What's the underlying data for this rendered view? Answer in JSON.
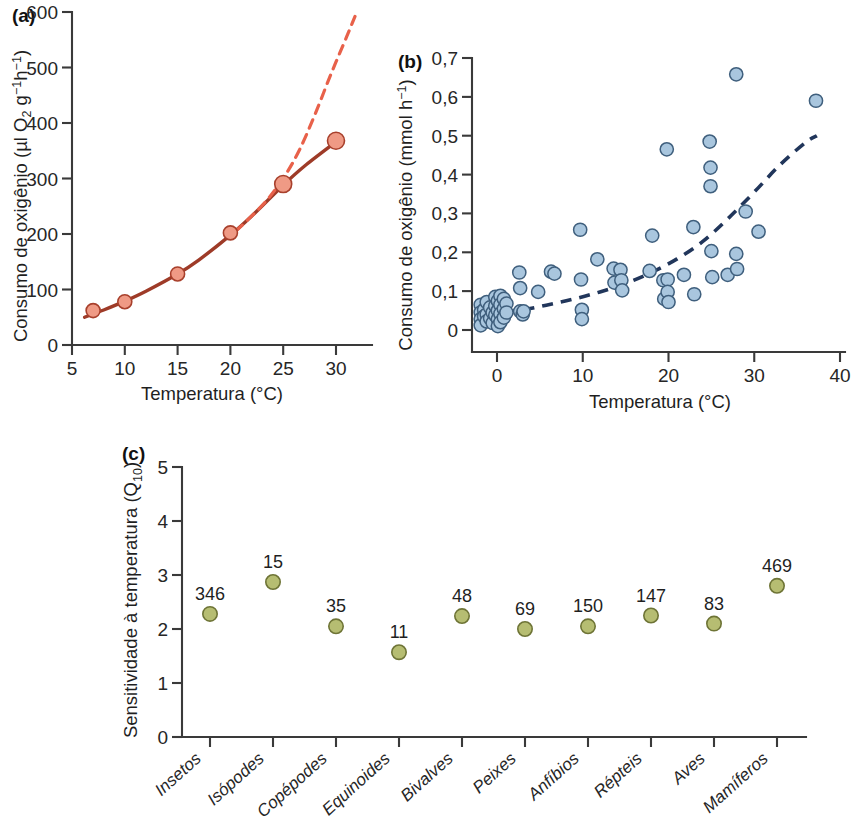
{
  "figure": {
    "panels": [
      "a",
      "b",
      "c"
    ]
  },
  "chart_data": [
    {
      "id": "panel-a",
      "type": "scatter",
      "panel_tag": "(a)",
      "title": "",
      "xlabel": "Temperatura (°C)",
      "ylabel_parts": {
        "prefix": "Consumo de oxigênio (µl O",
        "sub1": "2",
        "mid": " g",
        "sup1": "−1",
        "mid2": "h",
        "sup2": "−1",
        "suffix": ")"
      },
      "ylabel": "Consumo de oxigênio (µl O2 g−1h−1)",
      "xlim": [
        5,
        32.5
      ],
      "ylim": [
        0,
        600
      ],
      "xticks": [
        5,
        10,
        15,
        20,
        25,
        30
      ],
      "xticklabels": [
        "5",
        "10",
        "15",
        "20",
        "25",
        "30"
      ],
      "yticks": [
        0,
        100,
        200,
        300,
        400,
        500,
        600
      ],
      "yticklabels": [
        "0",
        "100",
        "200",
        "300",
        "400",
        "500",
        "600"
      ],
      "grid": false,
      "legend": "none",
      "marker_color": "#ef9a85",
      "marker_edge_color": "#a8402c",
      "points": [
        {
          "x": 7,
          "y": 62
        },
        {
          "x": 10,
          "y": 78
        },
        {
          "x": 15,
          "y": 128
        },
        {
          "x": 20,
          "y": 202
        },
        {
          "x": 25,
          "y": 290
        },
        {
          "x": 30,
          "y": 368
        }
      ],
      "curves": [
        {
          "name": "curva-ajustada-solida",
          "style": "solid",
          "color": "#9e3b28",
          "points": [
            {
              "x": 6.2,
              "y": 50
            },
            {
              "x": 7,
              "y": 56
            },
            {
              "x": 8,
              "y": 63
            },
            {
              "x": 10,
              "y": 79
            },
            {
              "x": 12,
              "y": 97
            },
            {
              "x": 15,
              "y": 128
            },
            {
              "x": 17,
              "y": 153
            },
            {
              "x": 20,
              "y": 198
            },
            {
              "x": 22,
              "y": 232
            },
            {
              "x": 25,
              "y": 288
            },
            {
              "x": 27,
              "y": 322
            },
            {
              "x": 30,
              "y": 366
            }
          ]
        },
        {
          "name": "curva-extrapolada-tracejada",
          "style": "dashed",
          "color": "#e8614a",
          "points": [
            {
              "x": 20.5,
              "y": 205
            },
            {
              "x": 22,
              "y": 232
            },
            {
              "x": 23.5,
              "y": 262
            },
            {
              "x": 25,
              "y": 300
            },
            {
              "x": 26.5,
              "y": 350
            },
            {
              "x": 28,
              "y": 415
            },
            {
              "x": 29.5,
              "y": 487
            },
            {
              "x": 31,
              "y": 555
            },
            {
              "x": 31.8,
              "y": 592
            }
          ]
        }
      ]
    },
    {
      "id": "panel-b",
      "type": "scatter",
      "panel_tag": "(b)",
      "title": "",
      "xlabel": "Temperatura (°C)",
      "ylabel_parts": {
        "prefix": "Consumo de oxigênio (mmol h",
        "sup1": "−1",
        "suffix": ")"
      },
      "ylabel": "Consumo de oxigênio (mmol h−1)",
      "xlim": [
        -3,
        41
      ],
      "ylim": [
        0,
        0.7
      ],
      "xticks": [
        0,
        10,
        20,
        30,
        40
      ],
      "xticklabels": [
        "0",
        "10",
        "20",
        "30",
        "40"
      ],
      "yticks": [
        0,
        0.1,
        0.2,
        0.3,
        0.4,
        0.5,
        0.6,
        0.7
      ],
      "yticklabels": [
        "0",
        "0,1",
        "0,2",
        "0,3",
        "0,4",
        "0,5",
        "0,6",
        "0,7"
      ],
      "grid": false,
      "legend": "none",
      "marker_color": "#a9c6de",
      "marker_edge_color": "#3f5f7d",
      "points": [
        {
          "x": -1.9,
          "y": 0.065
        },
        {
          "x": -1.9,
          "y": 0.045
        },
        {
          "x": -1.9,
          "y": 0.028
        },
        {
          "x": -1.9,
          "y": 0.012
        },
        {
          "x": -1.5,
          "y": 0.052
        },
        {
          "x": -1.5,
          "y": 0.035
        },
        {
          "x": -1.2,
          "y": 0.072
        },
        {
          "x": -1.2,
          "y": 0.04
        },
        {
          "x": -1.2,
          "y": 0.022
        },
        {
          "x": -0.8,
          "y": 0.058
        },
        {
          "x": -0.8,
          "y": 0.03
        },
        {
          "x": -0.5,
          "y": 0.045
        },
        {
          "x": -0.5,
          "y": 0.018
        },
        {
          "x": -0.2,
          "y": 0.085
        },
        {
          "x": -0.2,
          "y": 0.062
        },
        {
          "x": -0.2,
          "y": 0.038
        },
        {
          "x": 0.1,
          "y": 0.075
        },
        {
          "x": 0.1,
          "y": 0.05
        },
        {
          "x": 0.1,
          "y": 0.028
        },
        {
          "x": 0.1,
          "y": 0.01
        },
        {
          "x": 0.4,
          "y": 0.088
        },
        {
          "x": 0.4,
          "y": 0.065
        },
        {
          "x": 0.4,
          "y": 0.042
        },
        {
          "x": 0.4,
          "y": 0.02
        },
        {
          "x": 0.8,
          "y": 0.08
        },
        {
          "x": 0.8,
          "y": 0.055
        },
        {
          "x": 0.8,
          "y": 0.032
        },
        {
          "x": 1.1,
          "y": 0.068
        },
        {
          "x": 1.1,
          "y": 0.045
        },
        {
          "x": 2.6,
          "y": 0.148
        },
        {
          "x": 2.7,
          "y": 0.108
        },
        {
          "x": 2.7,
          "y": 0.048
        },
        {
          "x": 3.0,
          "y": 0.04
        },
        {
          "x": 3.1,
          "y": 0.048
        },
        {
          "x": 4.8,
          "y": 0.098
        },
        {
          "x": 6.3,
          "y": 0.15
        },
        {
          "x": 6.7,
          "y": 0.145
        },
        {
          "x": 9.7,
          "y": 0.258
        },
        {
          "x": 9.8,
          "y": 0.13
        },
        {
          "x": 9.9,
          "y": 0.052
        },
        {
          "x": 9.9,
          "y": 0.028
        },
        {
          "x": 11.7,
          "y": 0.182
        },
        {
          "x": 13.6,
          "y": 0.158
        },
        {
          "x": 13.7,
          "y": 0.122
        },
        {
          "x": 14.4,
          "y": 0.155
        },
        {
          "x": 14.5,
          "y": 0.128
        },
        {
          "x": 14.6,
          "y": 0.102
        },
        {
          "x": 17.8,
          "y": 0.152
        },
        {
          "x": 18.1,
          "y": 0.243
        },
        {
          "x": 19.4,
          "y": 0.128
        },
        {
          "x": 19.5,
          "y": 0.08
        },
        {
          "x": 19.8,
          "y": 0.465
        },
        {
          "x": 19.9,
          "y": 0.13
        },
        {
          "x": 19.9,
          "y": 0.098
        },
        {
          "x": 20.0,
          "y": 0.072
        },
        {
          "x": 21.8,
          "y": 0.142
        },
        {
          "x": 22.9,
          "y": 0.265
        },
        {
          "x": 23.0,
          "y": 0.092
        },
        {
          "x": 24.8,
          "y": 0.485
        },
        {
          "x": 24.9,
          "y": 0.418
        },
        {
          "x": 24.9,
          "y": 0.37
        },
        {
          "x": 25.0,
          "y": 0.203
        },
        {
          "x": 25.1,
          "y": 0.136
        },
        {
          "x": 26.9,
          "y": 0.142
        },
        {
          "x": 27.9,
          "y": 0.658
        },
        {
          "x": 27.9,
          "y": 0.196
        },
        {
          "x": 28.0,
          "y": 0.157
        },
        {
          "x": 29.0,
          "y": 0.305
        },
        {
          "x": 30.5,
          "y": 0.253
        },
        {
          "x": 37.2,
          "y": 0.59
        }
      ],
      "curves": [
        {
          "name": "curva-ajustada-tracejada",
          "style": "dashed",
          "color": "#21365b",
          "points": [
            {
              "x": -1.3,
              "y": 0.04
            },
            {
              "x": 0,
              "y": 0.043
            },
            {
              "x": 3,
              "y": 0.052
            },
            {
              "x": 6,
              "y": 0.065
            },
            {
              "x": 9,
              "y": 0.08
            },
            {
              "x": 12,
              "y": 0.098
            },
            {
              "x": 15,
              "y": 0.12
            },
            {
              "x": 18,
              "y": 0.148
            },
            {
              "x": 21,
              "y": 0.183
            },
            {
              "x": 24,
              "y": 0.228
            },
            {
              "x": 27,
              "y": 0.288
            },
            {
              "x": 30,
              "y": 0.355
            },
            {
              "x": 33,
              "y": 0.425
            },
            {
              "x": 36,
              "y": 0.483
            },
            {
              "x": 37.3,
              "y": 0.5
            }
          ]
        }
      ]
    },
    {
      "id": "panel-c",
      "type": "scatter",
      "panel_tag": "(c)",
      "title": "",
      "xlabel": "",
      "ylabel_parts": {
        "prefix": "Sensitividade à temperatura (Q",
        "sub1": "10",
        "suffix": ")"
      },
      "ylabel": "Sensitividade à temperatura (Q10)",
      "ylim": [
        0,
        5
      ],
      "yticks": [
        0,
        1,
        2,
        3,
        4,
        5
      ],
      "yticklabels": [
        "0",
        "1",
        "2",
        "3",
        "4",
        "5"
      ],
      "grid": false,
      "legend": "none",
      "marker_color": "#b6bd72",
      "marker_edge_color": "#6e7436",
      "categories": [
        "Insetos",
        "Isópodes",
        "Copépodes",
        "Equinoides",
        "Bivalves",
        "Peixes",
        "Anfíbios",
        "Répteis",
        "Aves",
        "Mamíferos"
      ],
      "values": [
        2.28,
        2.87,
        2.05,
        1.57,
        2.24,
        2.0,
        2.05,
        2.25,
        2.1,
        2.8
      ],
      "point_labels": [
        "346",
        "15",
        "35",
        "11",
        "48",
        "69",
        "150",
        "147",
        "83",
        "469"
      ]
    }
  ]
}
